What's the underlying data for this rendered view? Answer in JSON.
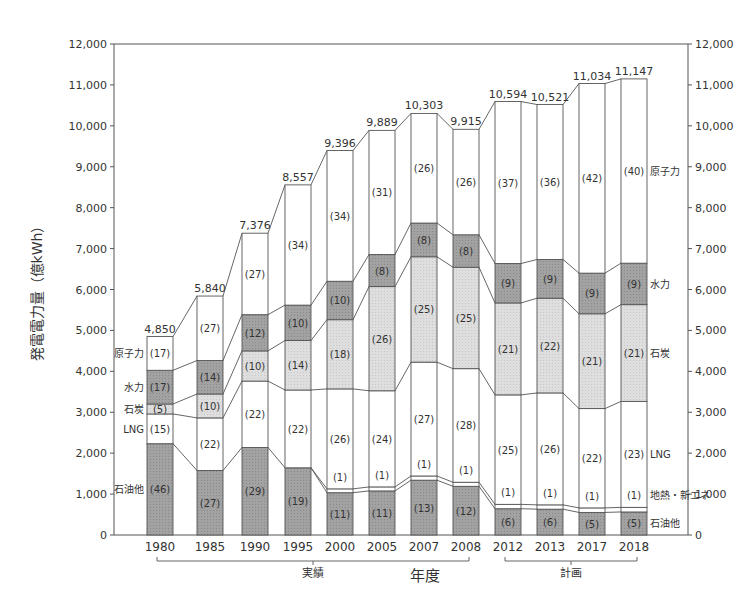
{
  "chart_data": {
    "type": "bar",
    "stacked": true,
    "title": "",
    "ylabel": "発電電力量（億kWh）",
    "xlabel": "年度",
    "ylim": [
      0,
      12000
    ],
    "yticks": [
      0,
      1000,
      2000,
      3000,
      4000,
      5000,
      6000,
      7000,
      8000,
      9000,
      10000,
      11000,
      12000
    ],
    "ytick_labels": [
      "0",
      "1,000",
      "2,000",
      "3,000",
      "4,000",
      "5,000",
      "6,000",
      "7,000",
      "8,000",
      "9,000",
      "10,000",
      "11,000",
      "12,000"
    ],
    "categories": [
      "1980",
      "1985",
      "1990",
      "1995",
      "2000",
      "2005",
      "2007",
      "2008",
      "2012",
      "2013",
      "2017",
      "2018"
    ],
    "totals": [
      4850,
      5840,
      7376,
      8557,
      9396,
      9889,
      10303,
      9915,
      10594,
      10521,
      11034,
      11147
    ],
    "total_labels": [
      "4,850",
      "5,840",
      "7,376",
      "8,557",
      "9,396",
      "9,889",
      "10,303",
      "9,915",
      "10,594",
      "10,521",
      "11,034",
      "11,147"
    ],
    "series": [
      {
        "name": "石油他",
        "color": "#9a9a9a",
        "percent": [
          46,
          27,
          29,
          19,
          11,
          11,
          13,
          12,
          6,
          6,
          5,
          5
        ]
      },
      {
        "name": "地熱・新エネ",
        "color": "#ffffff",
        "percent": [
          0,
          0,
          0,
          0,
          1,
          1,
          1,
          1,
          1,
          1,
          1,
          1
        ]
      },
      {
        "name": "LNG",
        "color": "#ffffff",
        "percent": [
          15,
          22,
          22,
          22,
          26,
          24,
          27,
          28,
          25,
          26,
          22,
          23
        ]
      },
      {
        "name": "石炭",
        "color": "#d8d8d8",
        "percent": [
          5,
          10,
          10,
          14,
          18,
          26,
          25,
          25,
          21,
          22,
          21,
          21
        ]
      },
      {
        "name": "水力",
        "color": "#9a9a9a",
        "percent": [
          17,
          14,
          12,
          10,
          10,
          8,
          8,
          8,
          9,
          9,
          9,
          9
        ]
      },
      {
        "name": "原子力",
        "color": "#ffffff",
        "percent": [
          17,
          27,
          27,
          34,
          34,
          31,
          26,
          26,
          37,
          36,
          42,
          40
        ]
      }
    ],
    "percent_labels": {
      "石油他": [
        "(46)",
        "(27)",
        "(29)",
        "(19)",
        "(11)",
        "(11)",
        "(13)",
        "(12)",
        "(6)",
        "(6)",
        "(5)",
        "(5)"
      ],
      "地熱・新エネ": [
        "",
        "",
        "",
        "",
        "(1)",
        "(1)",
        "(1)",
        "(1)",
        "(1)",
        "(1)",
        "(1)",
        "(1)"
      ],
      "LNG": [
        "(15)",
        "(22)",
        "(22)",
        "(22)",
        "(26)",
        "(24)",
        "(27)",
        "(28)",
        "(25)",
        "(26)",
        "(22)",
        "(23)"
      ],
      "石炭": [
        "(5)",
        "(10)",
        "(10)",
        "(14)",
        "(18)",
        "(26)",
        "(25)",
        "(25)",
        "(21)",
        "(22)",
        "(21)",
        "(21)"
      ],
      "水力": [
        "(17)",
        "(14)",
        "(12)",
        "(10)",
        "(10)",
        "(8)",
        "(8)",
        "(8)",
        "(9)",
        "(9)",
        "(9)",
        "(9)"
      ],
      "原子力": [
        "(17)",
        "(27)",
        "(27)",
        "(34)",
        "(34)",
        "(31)",
        "(26)",
        "(26)",
        "(37)",
        "(36)",
        "(42)",
        "(40)"
      ]
    },
    "left_labels": [
      "原子力",
      "水力",
      "石炭",
      "LNG",
      "石油他"
    ],
    "right_labels": [
      "原子力",
      "水力",
      "石炭",
      "LNG",
      "地熱・新エネ",
      "石油他"
    ],
    "groups": [
      {
        "label": "実績",
        "categories": [
          "1980",
          "1985",
          "1990",
          "1995",
          "2000",
          "2005",
          "2007",
          "2008"
        ]
      },
      {
        "label": "計画",
        "categories": [
          "2012",
          "2013",
          "2017",
          "2018"
        ]
      }
    ],
    "grid": false,
    "legend_position": "inline-labels"
  }
}
